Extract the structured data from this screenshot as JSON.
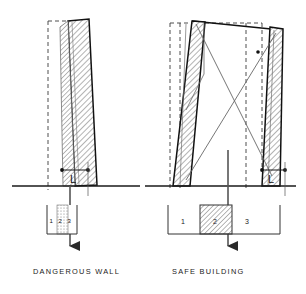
{
  "figure": {
    "background_color": "#ffffff",
    "ink_color": "#1a1a1a",
    "hatch_color": "#555555",
    "dashed_color": "#333333"
  },
  "panels": [
    {
      "id": "dangerous-wall",
      "caption": "DANGEROUS WALL",
      "dimension_label": "L",
      "description": "Single free-standing wall leaning strongly out of plumb; dashed outline marks original vertical position.",
      "zone_bar": {
        "labels": [
          "1",
          "2",
          "3"
        ],
        "hatched_zone": "2",
        "width_px": 30,
        "note": "narrow collapse zone band"
      }
    },
    {
      "id": "safe-building",
      "caption": "SAFE BUILDING",
      "dimension_label": "L",
      "description": "Two walls tied by a roof beam with diagonal cross-bracing; leaning is limited.",
      "zone_bar": {
        "labels": [
          "1",
          "2",
          "3"
        ],
        "hatched_zone": "2",
        "width_px": 112,
        "note": "wide zone band with central hatched zone 2"
      }
    }
  ],
  "annotations": {
    "ground_line": "ground level",
    "dashed_outline": "original vertical position",
    "arrow": "downward displacement arrow",
    "hatching": "masonry section hatch"
  }
}
